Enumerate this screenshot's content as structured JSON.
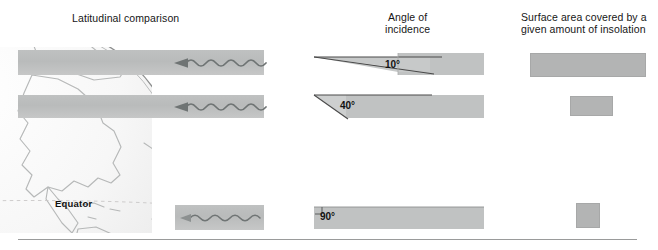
{
  "figure": {
    "type": "diagram",
    "columns": [
      {
        "id": "latitudinal",
        "heading": "Latitudinal comparison"
      },
      {
        "id": "angle",
        "heading": "Angle of\nincidence"
      },
      {
        "id": "area",
        "heading": "Surface area covered by a\ngiven amount of insolation"
      }
    ],
    "globe": {
      "label_equator": "Equator",
      "latitude_lines": 2,
      "continents": "Americas"
    },
    "rows": [
      {
        "id": "high-latitude",
        "angle_label": "10°",
        "angle_value": 10,
        "area_rank": "largest"
      },
      {
        "id": "middle-latitude",
        "angle_label": "40°",
        "angle_value": 40,
        "area_rank": "medium"
      },
      {
        "id": "equatorial",
        "angle_label": "90°",
        "angle_value": 90,
        "area_rank": "smallest"
      }
    ],
    "beams": {
      "ray_direction": "leftward",
      "ray_style": "wavy-arrow"
    },
    "colors": {
      "beam_grey": "#bfc1c1",
      "patch_grey": "#b3b4b4",
      "text": "#161616",
      "rule": "#9a9b9b"
    }
  }
}
